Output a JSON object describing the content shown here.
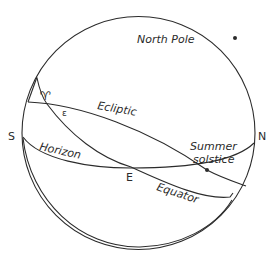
{
  "diagram": {
    "stroke_color": "#2b2b2b",
    "labels": {
      "north_pole": "North Pole",
      "ecliptic": "Ecliptic",
      "summer_solstice_line1": "Summer",
      "summer_solstice_line2": "solstice",
      "horizon": "Horizon",
      "equator": "Equator",
      "south": "S",
      "north": "N",
      "east": "E",
      "vernal_equinox_symbol": "♈",
      "obliquity_symbol": "ε"
    },
    "points": [
      {
        "name": "North Pole",
        "x": 235,
        "y": 38
      },
      {
        "name": "Summer solstice",
        "x": 207,
        "y": 170
      }
    ]
  }
}
